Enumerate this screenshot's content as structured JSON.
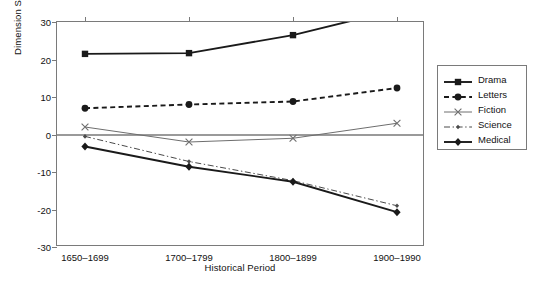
{
  "chart_data": {
    "type": "line",
    "title": "",
    "xlabel": "Historical Period",
    "ylabel": "Dimension Score",
    "categories": [
      "1650–1699",
      "1700–1799",
      "1800–1899",
      "1900–1990"
    ],
    "ylim": [
      -30,
      30
    ],
    "yticks": [
      30,
      20,
      10,
      0,
      -10,
      -20,
      -30
    ],
    "ytick_labels": [
      "30",
      "20",
      "10",
      "0",
      "-10",
      "-20",
      "-30"
    ],
    "grid": false,
    "zero_line": true,
    "legend_position": "right",
    "series": [
      {
        "name": "Drama",
        "values": [
          21.5,
          21.7,
          26.5,
          33.3
        ],
        "marker": "filled-square",
        "line": "solid",
        "color": "#1a1a1a",
        "width": 1.9
      },
      {
        "name": "Letters",
        "values": [
          7.0,
          8.0,
          8.8,
          12.4
        ],
        "marker": "filled-circle",
        "line": "dashed",
        "color": "#1a1a1a",
        "width": 1.9
      },
      {
        "name": "Fiction",
        "values": [
          2.0,
          -2.0,
          -1.0,
          3.0
        ],
        "marker": "x",
        "line": "solid",
        "color": "#6e6e6e",
        "width": 1.0
      },
      {
        "name": "Science",
        "values": [
          -0.5,
          -7.2,
          -12.3,
          -19.0
        ],
        "marker": "small-diamond",
        "line": "dash-dot",
        "color": "#4a4a4a",
        "width": 1.0
      },
      {
        "name": "Medical",
        "values": [
          -3.2,
          -8.6,
          -12.6,
          -20.7
        ],
        "marker": "filled-diamond",
        "line": "solid",
        "color": "#1a1a1a",
        "width": 1.9
      }
    ]
  },
  "legend": {
    "items": [
      {
        "label": "Drama"
      },
      {
        "label": "Letters"
      },
      {
        "label": "Fiction"
      },
      {
        "label": "Science"
      },
      {
        "label": "Medical"
      }
    ]
  }
}
